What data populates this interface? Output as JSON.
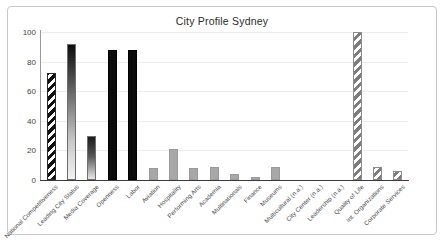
{
  "chart_data": {
    "type": "bar",
    "title": "City Profile Sydney",
    "xlabel": "",
    "ylabel": "",
    "ylim": [
      0,
      100
    ],
    "yticks": [
      0,
      20,
      40,
      60,
      80,
      100
    ],
    "grid": true,
    "legend": "none",
    "categories": [
      "National Competitiveness",
      "Leading City Status",
      "Media Coverage",
      "Openness",
      "Labor",
      "Aviation",
      "Hospitality",
      "Performing Arts",
      "Academia",
      "Multinationals",
      "Finance",
      "Museums",
      "Multicultural (n.a.)",
      "City Center (n.a.)",
      "Leadership (n.a.)",
      "Quality of Life",
      "Int. Organizations",
      "Corporate Services"
    ],
    "values": [
      72,
      92,
      30,
      88,
      88,
      8,
      21,
      8,
      9,
      4,
      2,
      9,
      null,
      null,
      null,
      100,
      9,
      6
    ],
    "bar_styles": [
      "diagonal-stripe-black",
      "vertical-gradient-dark",
      "vertical-gradient-dark",
      "solid-black",
      "solid-black",
      "solid-gray",
      "solid-gray",
      "solid-gray",
      "solid-gray",
      "solid-gray",
      "solid-gray",
      "solid-gray",
      "none",
      "none",
      "none",
      "diagonal-stripe-gray",
      "diagonal-stripe-gray",
      "diagonal-stripe-gray"
    ]
  },
  "colors": {
    "frame": "#c8c8c8",
    "axis": "#3a3a3a",
    "grid": "#ededed",
    "title": "#2b2b2b",
    "tick": "#444444",
    "bar_dark": "#0b0b0b",
    "bar_gray": "#a8a8a8"
  }
}
